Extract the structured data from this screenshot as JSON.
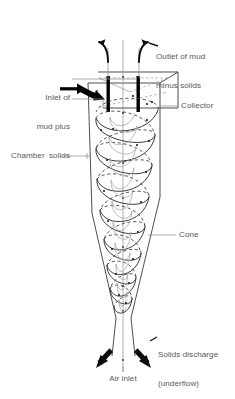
{
  "figure": {
    "type": "technical-diagram",
    "colors": {
      "outline": "#3b3b3d",
      "label_text": "#58585a",
      "leader_line": "#8a8a8c",
      "flow_path": "#3b3b3d",
      "solid_black": "#000000",
      "background": "#ffffff"
    }
  },
  "labels": {
    "outlet": {
      "line1": "Outlet of mud",
      "line2": "minus solids"
    },
    "inlet": {
      "line1": "Inlet of",
      "line2": "mud plus",
      "line3": "solids"
    },
    "collector": "Collector",
    "chamber": "Chamber",
    "cone": "Cone",
    "solids_discharge": {
      "line1": "Solids discharge",
      "line2": "(underflow)"
    },
    "air_inlet": "Air inlet"
  },
  "icons": {
    "inlet_arrow": "arrow-right-icon",
    "inlet_angled_arrow": "arrow-down-right-icon",
    "outlet_arrow_left": "curved-arrow-up-left-icon",
    "outlet_arrow_right": "curved-arrow-up-right-icon",
    "discharge_arrow_left": "arrow-down-left-icon",
    "discharge_arrow_right": "arrow-down-right-icon"
  },
  "components": [
    {
      "name": "collector",
      "description": "rectangular collector box at top of vessel"
    },
    {
      "name": "vortex-finder",
      "description": "two thick vertical bars forming overflow tube"
    },
    {
      "name": "chamber",
      "description": "upper cylindrical/slightly tapered chamber"
    },
    {
      "name": "cone",
      "description": "lower conical section narrowing to apex"
    },
    {
      "name": "underflow-nozzle",
      "description": "narrow outlet tube at bottom"
    },
    {
      "name": "helical-flow-path",
      "description": "spiral vortex flow path through vessel"
    },
    {
      "name": "centre-axis",
      "description": "vertical centre line / air core"
    }
  ]
}
